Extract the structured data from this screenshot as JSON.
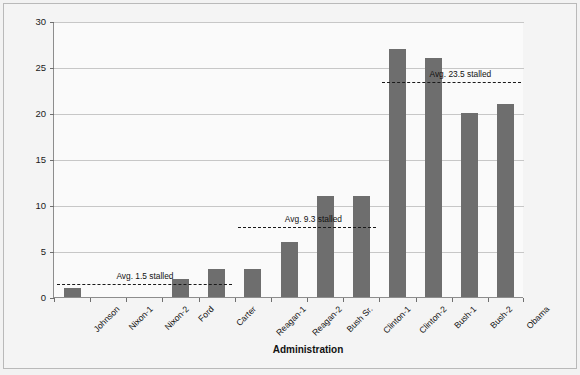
{
  "chart_data": {
    "type": "bar",
    "title": "",
    "xlabel": "Administration",
    "ylabel": "Nominations Stalled",
    "categories": [
      "Johnson",
      "Nixon-1",
      "Nixon-2",
      "Ford",
      "Carter",
      "Reagan-1",
      "Reagan-2",
      "Bush Sr.",
      "Clinton-1",
      "Clinton-2",
      "Bush-1",
      "Bush-2",
      "Obama"
    ],
    "values": [
      1,
      0,
      0,
      2,
      3,
      3,
      6,
      11,
      11,
      27,
      26,
      20,
      21
    ],
    "ylim": [
      0,
      30
    ],
    "yticks": [
      0,
      5,
      10,
      15,
      20,
      25,
      30
    ],
    "ytick_labels": [
      "0",
      "5",
      "10",
      "15",
      "20",
      "25",
      "30"
    ],
    "grid": true,
    "legend": "none",
    "bar_color": "#6e6e6e",
    "annotations": [
      {
        "label": "Avg. 1.5 stalled",
        "value": 1.5,
        "from_category": "Johnson",
        "to_category": "Carter"
      },
      {
        "label": "Avg. 9.3 stalled",
        "value": 7.7,
        "from_category": "Reagan-1",
        "to_category": "Clinton-1"
      },
      {
        "label": "Avg. 23.5 stalled",
        "value": 23.5,
        "from_category": "Clinton-2",
        "to_category": "Obama"
      }
    ]
  },
  "axes": {
    "y_title": "Nominations Stalled",
    "x_title": "Administration"
  }
}
